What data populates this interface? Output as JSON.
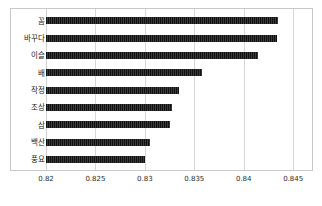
{
  "chart_data": {
    "type": "bar",
    "orientation": "horizontal",
    "title": "",
    "xlabel": "",
    "ylabel": "",
    "categories": [
      "꼼",
      "바꾸다",
      "이슬",
      "배",
      "작정",
      "조상",
      "삼",
      "백산",
      "풍요"
    ],
    "values": [
      0.8435,
      0.8434,
      0.8414,
      0.8358,
      0.8335,
      0.8327,
      0.8325,
      0.8305,
      0.83
    ],
    "xlim": [
      0.82,
      0.8465
    ],
    "xticks": [
      0.82,
      0.825,
      0.83,
      0.835,
      0.84,
      0.845
    ],
    "xtick_labels": [
      "0.82",
      "0.825",
      "0.83",
      "0.835",
      "0.84",
      "0.845"
    ],
    "grid": "vertical",
    "legend": "none",
    "bar_color": "#1a1a1a",
    "grid_color": "#d6d6d6",
    "frame_color": "#c9c9c9",
    "background": "#ffffff"
  }
}
